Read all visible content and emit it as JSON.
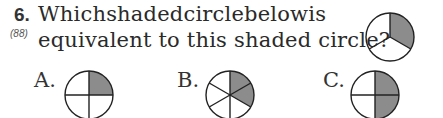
{
  "question": {
    "number": "6.",
    "reference": "(88)",
    "line1_words": [
      "Which",
      "shaded",
      "circle",
      "below",
      "is"
    ],
    "line2": "equivalent to this shaded circle?"
  },
  "reference_circle": {
    "divisions": 3,
    "shaded": 1,
    "fill": "#8c8c8c"
  },
  "options": [
    {
      "label": "A.",
      "divisions": 4,
      "shaded": 1
    },
    {
      "label": "B.",
      "divisions": 6,
      "shaded": 2
    },
    {
      "label": "C.",
      "divisions": 4,
      "shaded": 2
    }
  ],
  "colors": {
    "shade": "#8c8c8c",
    "stroke": "#222222"
  }
}
